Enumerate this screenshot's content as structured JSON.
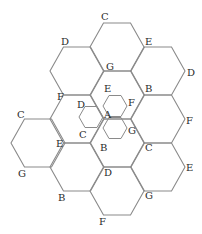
{
  "diagram": {
    "title": "",
    "stroke_color": "#8a8a8a",
    "label_color": "#2a2a2a",
    "large_hexagons": {
      "side": 27,
      "half_height": 24,
      "centers": [
        [
          117,
          47
        ],
        [
          77,
          71
        ],
        [
          158,
          71
        ],
        [
          77,
          119
        ],
        [
          117,
          95
        ],
        [
          158,
          119
        ],
        [
          38,
          143
        ],
        [
          117,
          143
        ],
        [
          77,
          167
        ],
        [
          158,
          167
        ],
        [
          117,
          191
        ]
      ]
    },
    "small_hexagons": {
      "side": 12,
      "half_height": 10.5,
      "centers": [
        [
          115,
          106
        ],
        [
          115,
          128
        ],
        [
          91,
          117
        ]
      ]
    },
    "labels": [
      {
        "text": "C",
        "x": 101,
        "y": 20
      },
      {
        "text": "D",
        "x": 61,
        "y": 45
      },
      {
        "text": "E",
        "x": 145,
        "y": 45
      },
      {
        "text": "G",
        "x": 106,
        "y": 70
      },
      {
        "text": "D",
        "x": 187,
        "y": 76
      },
      {
        "text": "F",
        "x": 57,
        "y": 100
      },
      {
        "text": "E",
        "x": 104,
        "y": 92
      },
      {
        "text": "B",
        "x": 145,
        "y": 92
      },
      {
        "text": "D",
        "x": 77,
        "y": 108
      },
      {
        "text": "F",
        "x": 128,
        "y": 106
      },
      {
        "text": "A",
        "x": 104,
        "y": 118
      },
      {
        "text": "C",
        "x": 17,
        "y": 118
      },
      {
        "text": "F",
        "x": 186,
        "y": 124
      },
      {
        "text": "C",
        "x": 79,
        "y": 138
      },
      {
        "text": "G",
        "x": 128,
        "y": 134
      },
      {
        "text": "E",
        "x": 56,
        "y": 147
      },
      {
        "text": "B",
        "x": 100,
        "y": 151
      },
      {
        "text": "C",
        "x": 145,
        "y": 151
      },
      {
        "text": "G",
        "x": 18,
        "y": 177
      },
      {
        "text": "D",
        "x": 104,
        "y": 176
      },
      {
        "text": "E",
        "x": 186,
        "y": 171
      },
      {
        "text": "B",
        "x": 58,
        "y": 201
      },
      {
        "text": "G",
        "x": 145,
        "y": 199
      },
      {
        "text": "F",
        "x": 99,
        "y": 225
      }
    ]
  }
}
